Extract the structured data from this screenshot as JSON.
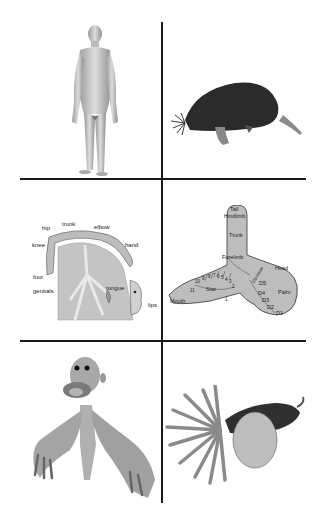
{
  "figure": {
    "layout": "3 rows x 2 columns grid separated by black cross lines",
    "panels": [
      {
        "row": 1,
        "col": 1,
        "subject": "human body (standing adult male, grayscale)"
      },
      {
        "row": 1,
        "col": 2,
        "subject": "star-nosed mole (dark fur, side view)"
      },
      {
        "row": 2,
        "col": 1,
        "subject": "human somatosensory homunculus over brain cross-section",
        "labels": [
          "hip",
          "trunk",
          "elbow",
          "knee",
          "hand",
          "foot",
          "genitals",
          "tongue",
          "lips"
        ]
      },
      {
        "row": 2,
        "col": 2,
        "subject": "star-nosed mole somatosensory cortex map",
        "labels": [
          "Tail",
          "Hindlimb",
          "Trunk",
          "Forelimb",
          "Head",
          "Vibrissae",
          "D5",
          "D4",
          "D3",
          "D2",
          "D1",
          "Palm",
          "Star",
          "Mouth",
          "11",
          "10",
          "9",
          "8",
          "7",
          "6",
          "5",
          "4",
          "3",
          "2",
          "1"
        ]
      },
      {
        "row": 3,
        "col": 1,
        "subject": "distorted human homunculus with huge hands and lips"
      },
      {
        "row": 3,
        "col": 2,
        "subject": "distorted mole with huge star-nose rays and forepaws"
      }
    ]
  },
  "human_map": {
    "hip": "hip",
    "trunk": "trunk",
    "elbow": "elbow",
    "knee": "knee",
    "hand": "hand",
    "foot": "foot",
    "genitals": "genitals",
    "tongue": "tongue",
    "lips": "lips"
  },
  "mole_map": {
    "tail": "Tail",
    "hindlimb": "Hindlimb",
    "trunk": "Trunk",
    "forelimb": "Forelimb",
    "head": "Head",
    "vibrissae": "Vibrissae",
    "palm": "Palm",
    "star": "Star",
    "mouth": "Mouth",
    "d5": "D5",
    "d4": "D4",
    "d3": "D3",
    "d2": "D2",
    "d1": "D1",
    "rays": [
      "11",
      "10",
      "9",
      "8",
      "7",
      "6",
      "5",
      "4",
      "3",
      "2",
      "1"
    ]
  },
  "colors": {
    "line": "#1a1a1a",
    "map_fill": "#bdbdbd",
    "fur": "#2b2b2b",
    "skin": "#c9c9c9"
  }
}
